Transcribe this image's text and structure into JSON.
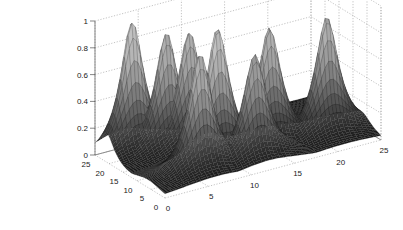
{
  "chart_data": {
    "type": "surface",
    "title": "",
    "xlabel": "",
    "ylabel": "",
    "zlabel": "",
    "x_ticks": [
      0,
      5,
      10,
      15,
      20,
      25
    ],
    "y_ticks": [
      0,
      5,
      10,
      15,
      20,
      25
    ],
    "z_ticks": [
      0,
      0.2,
      0.4,
      0.6,
      0.8,
      1
    ],
    "z_tick_labels": [
      "0",
      "0.2",
      "0.4",
      "0.6",
      "0.8",
      "1"
    ],
    "xlim": [
      0,
      25
    ],
    "ylim": [
      0,
      25
    ],
    "zlim": [
      0,
      1
    ],
    "grid": true,
    "colormap": "gray",
    "peaks": [
      {
        "x": 3,
        "y": 21,
        "z": 1.0
      },
      {
        "x": 6,
        "y": 18,
        "z": 0.9
      },
      {
        "x": 8,
        "y": 16,
        "z": 0.9
      },
      {
        "x": 6,
        "y": 6,
        "z": 0.9
      },
      {
        "x": 9,
        "y": 9,
        "z": 1.0
      },
      {
        "x": 12,
        "y": 5,
        "z": 0.8
      },
      {
        "x": 15,
        "y": 9,
        "z": 0.9
      },
      {
        "x": 21,
        "y": 7,
        "z": 0.9
      }
    ],
    "peak_width": 1.6
  }
}
